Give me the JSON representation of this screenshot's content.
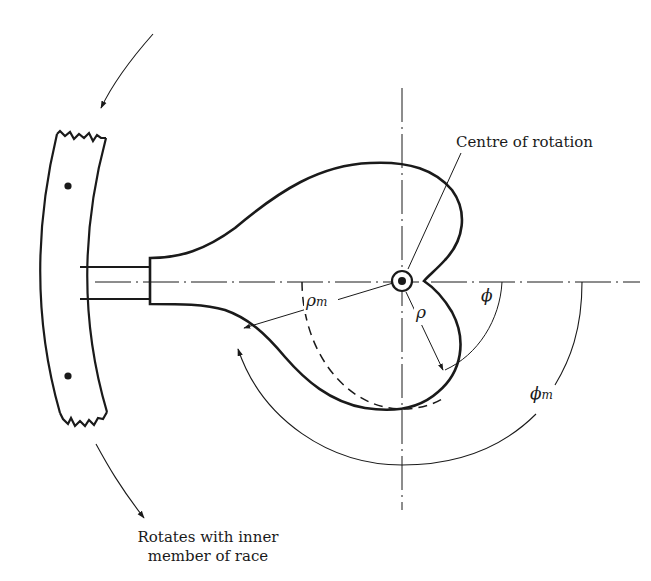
{
  "figure": {
    "type": "mechanical-diagram",
    "colors": {
      "ink": "#1a1a1a",
      "background": "#ffffff"
    }
  },
  "labels": {
    "centre_of_rotation": "Centre of rotation",
    "rotates_line1": "Rotates with inner",
    "rotates_line2": "member of race",
    "rho": "ρ",
    "rho_m": "ρ",
    "rho_m_sub": "m",
    "phi": "ϕ",
    "phi_m": "ϕ",
    "phi_m_sub": "m"
  },
  "elements": {
    "race_segment": {
      "description": "Curved band segment of inner race with broken (jagged) ends and two rivet dots"
    },
    "stem": {
      "description": "Straight rectangular stem attaching cam to race"
    },
    "cam_profile": {
      "description": "Heart-shaped cam profile with notch at centre line"
    },
    "centre_mark": {
      "description": "Double circle marking centre of rotation"
    },
    "centre_lines": {
      "description": "Dash-dot horizontal and vertical centre lines"
    },
    "dashed_circle": {
      "description": "Dashed arc of radius rho_m"
    },
    "rotation_arrows": {
      "description": "Two curved arrows indicating direction of rotation of race"
    },
    "angle_arcs": {
      "description": "Arcs indicating angles phi and phi_m from horizontal"
    }
  }
}
